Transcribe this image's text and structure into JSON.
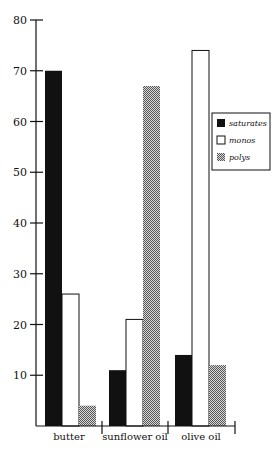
{
  "chart_data": {
    "type": "bar",
    "title": "",
    "xlabel": "",
    "ylabel": "",
    "categories": [
      "butter",
      "sunflower oil",
      "olive oil"
    ],
    "series": [
      {
        "name": "saturates",
        "values": [
          70,
          11,
          14
        ],
        "fill": "#111111"
      },
      {
        "name": "monos",
        "values": [
          26,
          21,
          74
        ],
        "fill": "#ffffff"
      },
      {
        "name": "polys",
        "values": [
          4,
          67,
          12
        ],
        "fill": "#9a9a9a"
      }
    ],
    "ylim": [
      0,
      80
    ],
    "yticks": [
      10,
      20,
      30,
      40,
      50,
      60,
      70,
      80
    ],
    "grid": false,
    "legend_position": "right"
  }
}
